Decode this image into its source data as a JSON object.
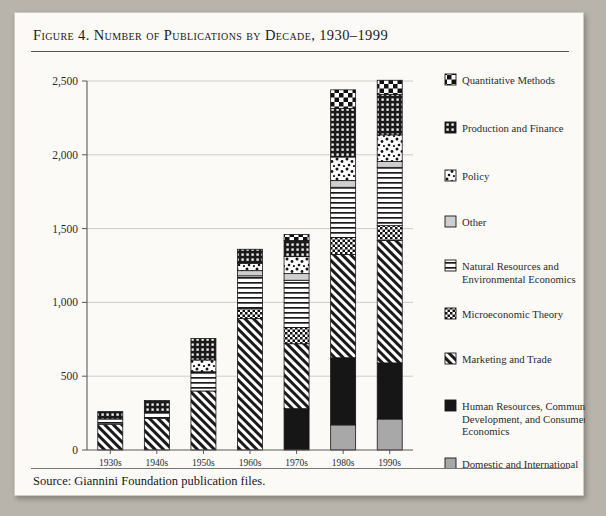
{
  "figure": {
    "title": "Figure 4. Number of Publications by Decade, 1930–1999",
    "source": "Source: Giannini Foundation publication files."
  },
  "chart_data": {
    "type": "bar",
    "stacked": true,
    "title": "Figure 4. Number of Publications by Decade, 1930–1999",
    "xlabel": "",
    "ylabel": "",
    "ylim": [
      0,
      2500
    ],
    "yticks": [
      0,
      500,
      1000,
      1500,
      2000,
      2500
    ],
    "ytick_labels": [
      "0",
      "500",
      "1,000",
      "1,500",
      "2,000",
      "2,500"
    ],
    "grid": true,
    "legend_position": "right",
    "categories": [
      "1930s",
      "1940s",
      "1950s",
      "1960s",
      "1970s",
      "1980s",
      "1990s"
    ],
    "series": [
      {
        "name": "Domestic and International Economic Development",
        "pattern": "solid-gray",
        "values": [
          0,
          0,
          0,
          0,
          0,
          170,
          210
        ]
      },
      {
        "name": "Human Resources, Community Development, and Consumer Economics",
        "pattern": "solid-black",
        "values": [
          0,
          0,
          0,
          0,
          280,
          455,
          380
        ]
      },
      {
        "name": "Marketing and Trade",
        "pattern": "diagonal",
        "values": [
          175,
          215,
          400,
          890,
          440,
          700,
          830
        ]
      },
      {
        "name": "Microeconomic Theory",
        "pattern": "checker-small",
        "values": [
          0,
          0,
          0,
          70,
          110,
          115,
          100
        ]
      },
      {
        "name": "Natural Resources and Environmental Economics",
        "pattern": "horizontal",
        "values": [
          35,
          45,
          130,
          220,
          320,
          340,
          395
        ]
      },
      {
        "name": "Other",
        "pattern": "solid-lightgray",
        "values": [
          0,
          0,
          0,
          35,
          45,
          45,
          40
        ]
      },
      {
        "name": "Policy",
        "pattern": "speckle",
        "values": [
          0,
          0,
          80,
          50,
          115,
          160,
          180
        ]
      },
      {
        "name": "Production and Finance",
        "pattern": "grid",
        "values": [
          50,
          75,
          145,
          95,
          110,
          330,
          275
        ]
      },
      {
        "name": "Quantitative Methods",
        "pattern": "checker-big",
        "values": [
          0,
          0,
          0,
          0,
          40,
          125,
          95
        ]
      }
    ],
    "legend_entries": [
      {
        "label": "Quantitative Methods",
        "pattern": "checker-big"
      },
      {
        "label": "Production and Finance",
        "pattern": "grid"
      },
      {
        "label": "Policy",
        "pattern": "speckle"
      },
      {
        "label": "Other",
        "pattern": "solid-lightgray"
      },
      {
        "label": "Natural Resources and Environmental Economics",
        "pattern": "horizontal"
      },
      {
        "label": "Microeconomic Theory",
        "pattern": "checker-small"
      },
      {
        "label": "Marketing and Trade",
        "pattern": "diagonal"
      },
      {
        "label": "Human Resources, Community Development, and Consumer Economics",
        "pattern": "solid-black"
      },
      {
        "label": "Domestic and International Economic Development",
        "pattern": "solid-gray"
      }
    ],
    "colors": {
      "black": "#161616",
      "gray": "#a8a8a8",
      "light_gray": "#cfcfcf",
      "grid_line": "#c9c6bf",
      "axis": "#5a5a5a",
      "background": "#fbfaf7"
    }
  }
}
